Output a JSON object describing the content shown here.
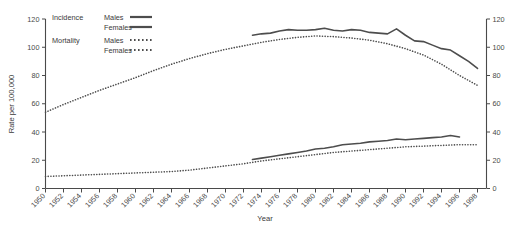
{
  "chart_data": {
    "type": "line",
    "title": "",
    "xlabel": "Year",
    "ylabel": "Rate per 100,000",
    "ylim": [
      0,
      120
    ],
    "xlim": [
      1950,
      1999
    ],
    "grid": false,
    "legend_position": "top-left",
    "y_ticks": [
      0,
      20,
      40,
      60,
      80,
      100,
      120
    ],
    "y_ticks_right": [
      0,
      20,
      40,
      60,
      80,
      100,
      120
    ],
    "x_ticks": [
      1950,
      1952,
      1954,
      1956,
      1958,
      1960,
      1962,
      1964,
      1966,
      1968,
      1970,
      1972,
      1974,
      1976,
      1978,
      1980,
      1982,
      1984,
      1986,
      1988,
      1990,
      1992,
      1994,
      1996,
      1998
    ],
    "series": [
      {
        "name": "Incidence Males",
        "group": "Incidence",
        "sex": "Males",
        "style": "solid",
        "x": [
          1973,
          1974,
          1975,
          1976,
          1977,
          1978,
          1979,
          1980,
          1981,
          1982,
          1983,
          1984,
          1985,
          1986,
          1987,
          1988,
          1989,
          1990,
          1991,
          1992,
          1993,
          1994,
          1995,
          1996
        ],
        "values": [
          108.5,
          109.5,
          110.0,
          111.5,
          112.5,
          112.0,
          112.0,
          112.5,
          113.5,
          112.0,
          111.5,
          112.5,
          112.0,
          110.5,
          110.0,
          109.5,
          113.0,
          108.5,
          104.5,
          104.0,
          101.5,
          99.0,
          98.0,
          94.0
        ],
        "values_tail_x": [
          1997,
          1998
        ],
        "values_tail": [
          90.0,
          85.0
        ]
      },
      {
        "name": "Mortality Males",
        "group": "Mortality",
        "sex": "Males",
        "style": "dotted",
        "x": [
          1950,
          1952,
          1954,
          1956,
          1958,
          1960,
          1962,
          1964,
          1966,
          1968,
          1970,
          1972,
          1974,
          1976,
          1978,
          1980,
          1982,
          1984,
          1986,
          1988,
          1990,
          1992,
          1994,
          1996,
          1998
        ],
        "values": [
          54.0,
          59.5,
          64.5,
          69.5,
          74.0,
          78.5,
          83.5,
          88.0,
          92.0,
          95.5,
          98.5,
          101.0,
          103.5,
          105.5,
          107.0,
          108.0,
          107.5,
          106.5,
          105.0,
          102.5,
          99.0,
          94.5,
          88.0,
          80.0,
          73.0
        ]
      },
      {
        "name": "Incidence Females",
        "group": "Incidence",
        "sex": "Females",
        "style": "solid",
        "x": [
          1973,
          1974,
          1975,
          1976,
          1977,
          1978,
          1979,
          1980,
          1981,
          1982,
          1983,
          1984,
          1985,
          1986,
          1987,
          1988,
          1989,
          1990,
          1991,
          1992,
          1993,
          1994,
          1995,
          1996
        ],
        "values": [
          20.5,
          21.5,
          22.5,
          23.5,
          24.5,
          25.5,
          26.5,
          28.0,
          28.5,
          29.5,
          31.0,
          31.5,
          32.0,
          33.0,
          33.5,
          34.0,
          35.0,
          34.5,
          35.0,
          35.5,
          36.0,
          36.5,
          37.5,
          36.5
        ]
      },
      {
        "name": "Mortality Females",
        "group": "Mortality",
        "sex": "Females",
        "style": "dotted",
        "x": [
          1950,
          1952,
          1954,
          1956,
          1958,
          1960,
          1962,
          1964,
          1966,
          1968,
          1970,
          1972,
          1974,
          1976,
          1978,
          1980,
          1982,
          1984,
          1986,
          1988,
          1990,
          1992,
          1994,
          1996,
          1998
        ],
        "values": [
          8.5,
          9.0,
          9.5,
          10.0,
          10.5,
          11.0,
          11.5,
          12.0,
          13.0,
          14.5,
          16.0,
          17.5,
          19.5,
          21.0,
          22.5,
          24.0,
          25.5,
          26.5,
          27.5,
          28.5,
          29.5,
          30.0,
          30.5,
          31.0,
          31.0
        ]
      }
    ]
  },
  "legend": {
    "rows": [
      {
        "group": "Incidence",
        "sex": "Males",
        "style": "solid"
      },
      {
        "group": "",
        "sex": "Females",
        "style": "solid"
      },
      {
        "group": "Mortality",
        "sex": "Males",
        "style": "dotted"
      },
      {
        "group": "",
        "sex": "Females",
        "style": "dotted"
      }
    ]
  },
  "colors": {
    "line": "#4d4d4d",
    "axis": "#4a4a4a",
    "text": "#3a3a3a",
    "background": "#ffffff"
  }
}
